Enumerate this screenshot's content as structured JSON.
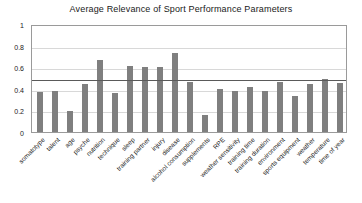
{
  "chart_data": {
    "type": "bar",
    "title": "Average Relevance of Sport Performance Parameters",
    "xlabel": "",
    "ylabel": "",
    "ylim": [
      0,
      1
    ],
    "yticks": [
      "0",
      "0.2",
      "0.4",
      "0.6",
      "0.8",
      "1"
    ],
    "ytick_values": [
      0,
      0.2,
      0.4,
      0.6,
      0.8,
      1
    ],
    "grid": true,
    "legend": false,
    "bar_color": "#7f7f7f",
    "reference_line": {
      "value": 0.5,
      "color": "#5a5a5a",
      "label": ""
    },
    "categories": [
      "somatotype",
      "talent",
      "age",
      "psyche",
      "nutrition",
      "technique",
      "sleep",
      "training partner",
      "injury",
      "disease",
      "alcohol consumption",
      "supplements",
      "RPE",
      "weather sensitivity",
      "training time",
      "training duration",
      "environment",
      "sports equipment",
      "weather",
      "temperature",
      "time of year"
    ],
    "values": [
      0.37,
      0.38,
      0.19,
      0.44,
      0.67,
      0.36,
      0.61,
      0.6,
      0.6,
      0.73,
      0.46,
      0.16,
      0.4,
      0.38,
      0.42,
      0.38,
      0.46,
      0.33,
      0.44,
      0.49,
      0.45
    ]
  }
}
